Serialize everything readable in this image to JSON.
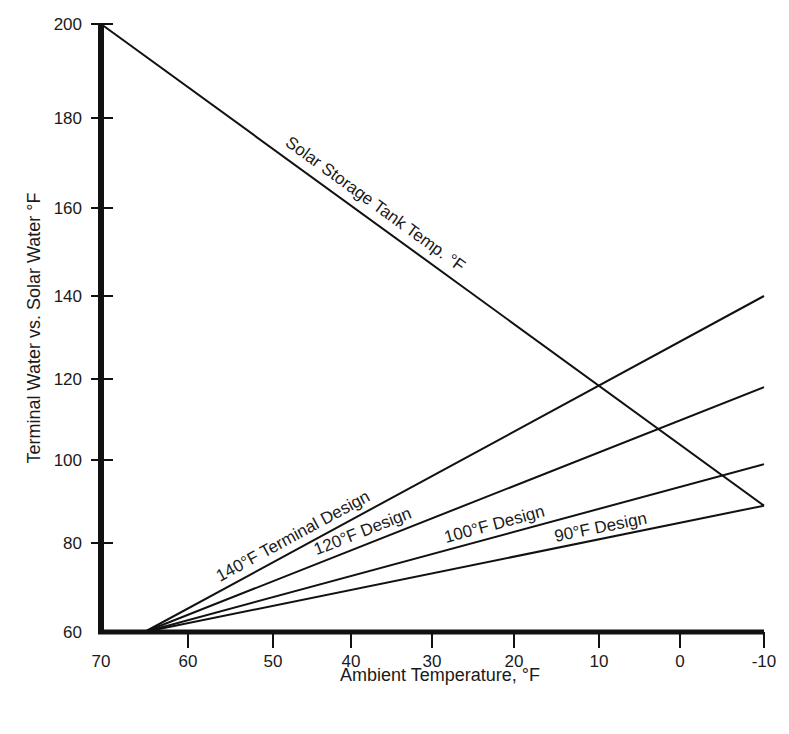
{
  "chart_data": {
    "type": "line",
    "title": "",
    "xlabel": "Ambient Temperature, °F",
    "ylabel": "Terminal Water vs. Solar Water °F",
    "xlim": [
      70,
      -10
    ],
    "ylim": [
      60,
      200
    ],
    "x_reversed": true,
    "grid": false,
    "legend": "none (inline labels on lines)",
    "x_ticks": [
      70,
      60,
      50,
      40,
      30,
      20,
      10,
      0,
      -10
    ],
    "y_ticks": [
      60,
      80,
      100,
      120,
      140,
      160,
      180,
      200
    ],
    "series": [
      {
        "name": "Solar Storage Tank Temp. °F",
        "x": [
          70,
          -10
        ],
        "y": [
          200,
          89
        ],
        "label_text": "Solar Storage Tank Temp. °F"
      },
      {
        "name": "140°F Terminal Design",
        "x": [
          65,
          -10
        ],
        "y": [
          60,
          140
        ],
        "label_text": "140°F Terminal Design"
      },
      {
        "name": "120°F Design",
        "x": [
          65,
          -10
        ],
        "y": [
          60,
          118
        ],
        "label_text": "120°F Design"
      },
      {
        "name": "100°F Design",
        "x": [
          65,
          -10
        ],
        "y": [
          60,
          99
        ],
        "label_text": "100°F Design"
      },
      {
        "name": "90°F Design",
        "x": [
          65,
          -10
        ],
        "y": [
          60,
          89
        ],
        "label_text": "90°F Design"
      }
    ]
  },
  "axes": {
    "x_title": "Ambient Temperature, °F",
    "y_title": "Terminal Water vs. Solar Water °F"
  }
}
